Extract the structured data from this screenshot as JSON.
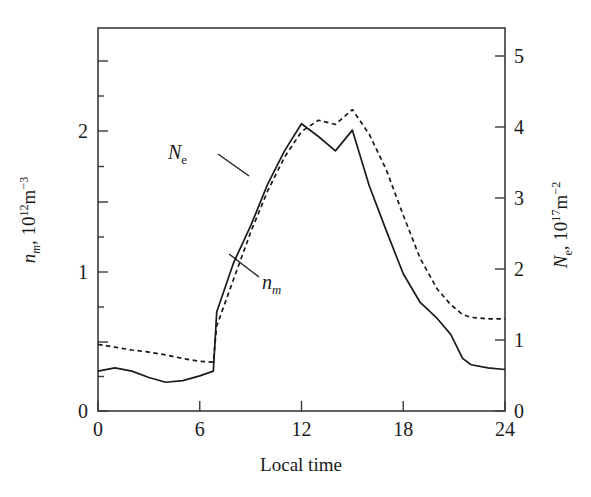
{
  "chart_data": {
    "type": "line",
    "title": "",
    "xlabel": "Local time",
    "ylabel_left": "n_m, 10^12 m^-3",
    "ylabel_right": "N_e, 10^17 m^-2",
    "xlim": [
      0,
      24
    ],
    "ylim_left": [
      0,
      2.4
    ],
    "ylim_right": [
      0,
      5.4
    ],
    "xticks": [
      0,
      6,
      12,
      18,
      24
    ],
    "xticklabels": [
      "0",
      "6",
      "12",
      "18",
      "24"
    ],
    "yticks_left": [
      0,
      1,
      2
    ],
    "yticklabels_left": [
      "0",
      "1",
      "2"
    ],
    "yticks_right": [
      0,
      1,
      2,
      3,
      4,
      5
    ],
    "yticklabels_right": [
      "0",
      "1",
      "2",
      "3",
      "4",
      "5"
    ],
    "grid": false,
    "legend": "inline-annotations",
    "x": [
      0,
      1,
      2,
      3,
      4,
      5,
      6,
      6.8,
      7,
      8,
      9,
      10,
      11,
      12,
      13,
      14,
      15,
      16,
      17,
      18,
      19,
      20,
      20.8,
      21.5,
      22,
      23,
      24
    ],
    "series": [
      {
        "name": "n_m",
        "axis": "left",
        "style": "solid",
        "color": "#1a1a1a",
        "units": "10^12 m^-3",
        "values": [
          0.25,
          0.27,
          0.25,
          0.21,
          0.18,
          0.19,
          0.22,
          0.25,
          0.62,
          0.93,
          1.16,
          1.42,
          1.63,
          1.8,
          1.72,
          1.63,
          1.76,
          1.41,
          1.13,
          0.86,
          0.68,
          0.58,
          0.48,
          0.33,
          0.29,
          0.27,
          0.26
        ]
      },
      {
        "name": "N_e",
        "axis": "right",
        "style": "dashed",
        "color": "#1a1a1a",
        "units": "10^17 m^-2",
        "values": [
          0.94,
          0.9,
          0.86,
          0.83,
          0.79,
          0.74,
          0.7,
          0.69,
          1.2,
          1.86,
          2.52,
          3.1,
          3.58,
          3.94,
          4.1,
          4.04,
          4.25,
          3.9,
          3.4,
          2.76,
          2.15,
          1.72,
          1.5,
          1.36,
          1.32,
          1.3,
          1.3
        ]
      }
    ],
    "annotations": [
      {
        "name": "N_e",
        "text": "Ne",
        "x_px": 168,
        "y_px": 142
      },
      {
        "name": "n_m",
        "text": "nm",
        "x_px": 262,
        "y_px": 272
      }
    ]
  },
  "axes": {
    "x_title": "Local time",
    "y_left": {
      "symbol": "n",
      "sub": "m",
      "sep": ", 10",
      "exp": "12",
      "unit": "m",
      "unit_exp": "−3"
    },
    "y_right": {
      "symbol": "N",
      "sub": "e",
      "sep": ", 10",
      "exp": "17",
      "unit": "m",
      "unit_exp": "−2"
    }
  },
  "labels": {
    "ne_symbol": "N",
    "ne_sub": "e",
    "nm_symbol": "n",
    "nm_sub": "m"
  },
  "colors": {
    "axis": "#3a3a3a",
    "curve": "#1a1a1a",
    "background": "#ffffff"
  },
  "geometry": {
    "left_px": 98,
    "right_px": 505,
    "top_px": 28,
    "bottom_px": 411
  }
}
